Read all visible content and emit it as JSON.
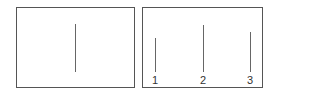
{
  "left_panel": {
    "lines": [
      {
        "x": 75,
        "top": 24,
        "bottom": 72
      }
    ]
  },
  "right_panel": {
    "lines": [
      {
        "label": "1",
        "x": 155,
        "top": 38,
        "bottom": 72
      },
      {
        "label": "2",
        "x": 203,
        "top": 25,
        "bottom": 72
      },
      {
        "label": "3",
        "x": 250,
        "top": 32,
        "bottom": 72
      }
    ]
  },
  "colors": {
    "border": "#555555",
    "line": "#666666",
    "text": "#333333"
  }
}
